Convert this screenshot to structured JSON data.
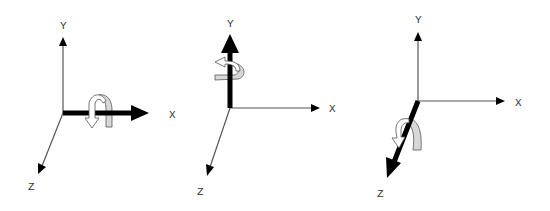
{
  "figure": {
    "colors": {
      "axis_thin": "#444444",
      "axis_bold": "#000000",
      "rotation_fill_front": "#ffffff",
      "rotation_fill_back": "#d8d8d8",
      "label": "#333333"
    },
    "diagrams": [
      {
        "id": "rotation-x",
        "highlighted_axis": "X",
        "labels": {
          "y": "Y",
          "x": "X",
          "z": "Z"
        }
      },
      {
        "id": "rotation-y",
        "highlighted_axis": "Y",
        "labels": {
          "y": "Y",
          "x": "X",
          "z": "Z"
        }
      },
      {
        "id": "rotation-z",
        "highlighted_axis": "Z",
        "labels": {
          "y": "Y",
          "x": "X",
          "z": "Z"
        }
      }
    ]
  }
}
